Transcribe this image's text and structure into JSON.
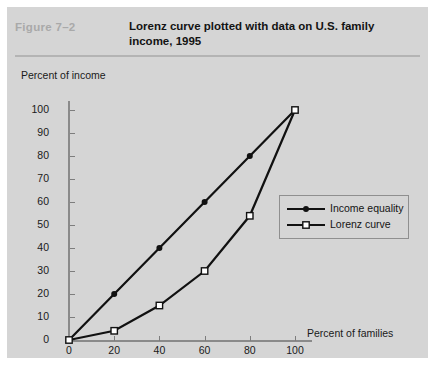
{
  "header": {
    "figure_number": "Figure  7–2",
    "title_line1": "Lorenz curve plotted with data on U.S. family",
    "title_line2": "income, 1995"
  },
  "colors": {
    "panel_background": "#d5d5d5",
    "page_background": "#ffffff",
    "figure_number_text": "#a9a9a9",
    "title_text": "#131313",
    "axis_line": "#8a8a8a",
    "series_line": "#111111",
    "legend_border": "#8f8f8f",
    "marker_open_fill": "#ffffff"
  },
  "chart_data": {
    "type": "line",
    "title": "Lorenz curve plotted with data on U.S. family income, 1995",
    "subtitle": "",
    "xlabel": "Percent of families",
    "ylabel": "Percent of income",
    "xlim": [
      0,
      100
    ],
    "ylim": [
      0,
      100
    ],
    "xticks": [
      0,
      20,
      40,
      60,
      80,
      100
    ],
    "yticks": [
      0,
      10,
      20,
      30,
      40,
      50,
      60,
      70,
      80,
      90,
      100
    ],
    "grid": false,
    "legend_position": "inside-right",
    "series": [
      {
        "name": "Income  equality",
        "marker": "filled-circle",
        "x": [
          0,
          20,
          40,
          60,
          80,
          100
        ],
        "values": [
          0,
          20,
          40,
          60,
          80,
          100
        ]
      },
      {
        "name": "Lorenz curve",
        "marker": "open-square",
        "x": [
          0,
          20,
          40,
          60,
          80,
          100
        ],
        "values": [
          0,
          4,
          15,
          30,
          54,
          100
        ]
      }
    ]
  },
  "legend": {
    "items": [
      {
        "label": "Income  equality",
        "marker": "filled-circle"
      },
      {
        "label": "Lorenz curve",
        "marker": "open-square"
      }
    ]
  }
}
